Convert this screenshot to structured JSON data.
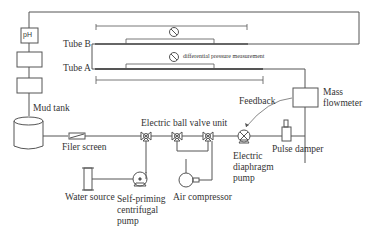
{
  "diagram": {
    "type": "process-flow-schematic",
    "colors": {
      "line": "#555555",
      "text": "#333333",
      "background": "#ffffff"
    },
    "components": {
      "ph_sensor": {
        "label": "pH"
      },
      "mud_tank": {
        "label": "Mud tank"
      },
      "filter_screen": {
        "label": "Filer screen"
      },
      "ball_valve_unit": {
        "label": "Electric ball valve unit"
      },
      "diaphragm_pump": {
        "label_lines": [
          "Electric",
          "diaphragm",
          "pump"
        ]
      },
      "pulse_damper": {
        "label": "Pulse damper"
      },
      "mass_flowmeter": {
        "label_lines": [
          "Mass",
          "flowmeter"
        ]
      },
      "feedback": {
        "label": "Feedback"
      },
      "water_source": {
        "label": "Water source"
      },
      "centrifugal_pump": {
        "label_lines": [
          "Self-priming",
          "centrifugal",
          "pump"
        ]
      },
      "air_compressor": {
        "label": "Air compressor"
      },
      "tube_b": {
        "label": "Tube B"
      },
      "tube_a": {
        "label": "Tube A"
      },
      "dp_measurement": {
        "label": "differential pressure measurement"
      }
    }
  }
}
